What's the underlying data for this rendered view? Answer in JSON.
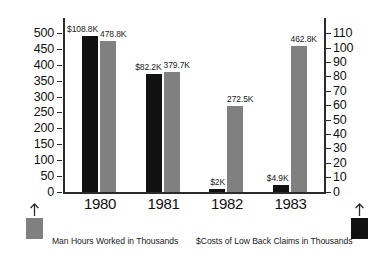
{
  "chart_data": {
    "type": "bar",
    "title": "",
    "subtitle": "",
    "xlabel": "",
    "categories": [
      "1980",
      "1981",
      "1982",
      "1983"
    ],
    "grid": false,
    "legend_position": "bottom",
    "series": [
      {
        "name": "$Costs of Low Back Claims in Thousands",
        "axis": "right",
        "color": "#111111",
        "values": [
          108.8,
          82.2,
          2.0,
          4.9
        ],
        "data_labels": [
          "$108.8K",
          "$82.2K",
          "$2K",
          "$4.9K"
        ]
      },
      {
        "name": "Man Hours Worked in Thousands",
        "axis": "left",
        "color": "#808080",
        "values": [
          478.8,
          379.7,
          272.5,
          462.8
        ],
        "data_labels": [
          "478.8K",
          "379.7K",
          "272.5K",
          "462.8K"
        ]
      }
    ],
    "axis_left": {
      "label": "",
      "ylim": [
        0,
        550
      ],
      "ticks": [
        0,
        50,
        100,
        150,
        200,
        250,
        300,
        350,
        400,
        450,
        500
      ],
      "tick_labels": [
        "0",
        "50",
        "100",
        "150",
        "200",
        "250",
        "300",
        "350",
        "400",
        "450",
        "500"
      ]
    },
    "axis_right": {
      "label": "",
      "ylim": [
        0,
        121
      ],
      "ticks": [
        0,
        10,
        20,
        30,
        40,
        50,
        60,
        70,
        80,
        90,
        100,
        110
      ],
      "tick_labels": [
        "0",
        "10",
        "20",
        "30",
        "40",
        "50",
        "60",
        "70",
        "80",
        "90",
        "100",
        "110"
      ]
    }
  },
  "legend": {
    "left": {
      "label": "Man Hours Worked in Thousands",
      "swatch_color": "#808080",
      "arrow": "up-arrow-icon"
    },
    "right": {
      "label": "$Costs of Low Back Claims in Thousands",
      "swatch_color": "#111111",
      "arrow": "up-arrow-icon"
    }
  }
}
